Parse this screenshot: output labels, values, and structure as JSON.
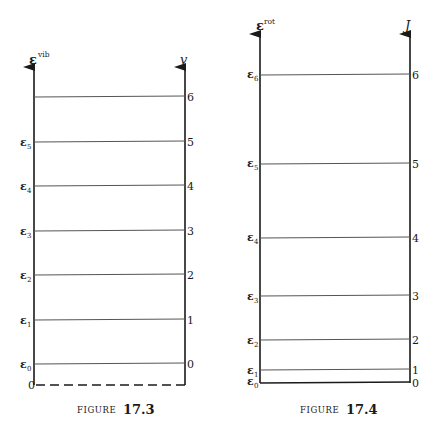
{
  "figures": [
    {
      "id": "fig-17-3",
      "caption_prefix": "FIGURE",
      "caption_number": "17.3",
      "left_axis_label": "ε",
      "left_axis_superscript": "vib",
      "right_axis_label": "v",
      "origin_label": "0",
      "baseline_style": "dashed",
      "levels": [
        {
          "quantum_number": "0",
          "energy_label": "ε",
          "energy_sub": "0",
          "y": 364
        },
        {
          "quantum_number": "1",
          "energy_label": "ε",
          "energy_sub": "1",
          "y": 320
        },
        {
          "quantum_number": "2",
          "energy_label": "ε",
          "energy_sub": "2",
          "y": 275
        },
        {
          "quantum_number": "3",
          "energy_label": "ε",
          "energy_sub": "3",
          "y": 231
        },
        {
          "quantum_number": "4",
          "energy_label": "ε",
          "energy_sub": "4",
          "y": 186
        },
        {
          "quantum_number": "5",
          "energy_label": "ε",
          "energy_sub": "5",
          "y": 142
        },
        {
          "quantum_number": "6",
          "energy_label": "",
          "energy_sub": "",
          "y": 97
        }
      ]
    },
    {
      "id": "fig-17-4",
      "caption_prefix": "FIGURE",
      "caption_number": "17.4",
      "left_axis_label": "ε",
      "left_axis_superscript": "rot",
      "right_axis_label": "J",
      "baseline_style": "solid",
      "levels": [
        {
          "quantum_number": "0",
          "energy_label": "ε",
          "energy_sub": "0",
          "y": 383
        },
        {
          "quantum_number": "1",
          "energy_label": "ε",
          "energy_sub": "1",
          "y": 370
        },
        {
          "quantum_number": "2",
          "energy_label": "ε",
          "energy_sub": "2",
          "y": 340
        },
        {
          "quantum_number": "3",
          "energy_label": "ε",
          "energy_sub": "3",
          "y": 296
        },
        {
          "quantum_number": "4",
          "energy_label": "ε",
          "energy_sub": "4",
          "y": 237
        },
        {
          "quantum_number": "5",
          "energy_label": "ε",
          "energy_sub": "5",
          "y": 163
        },
        {
          "quantum_number": "6",
          "energy_label": "ε",
          "energy_sub": "6",
          "y": 74
        }
      ]
    }
  ],
  "colors": {
    "ink": "#1a1a1a",
    "level_line": "#555555",
    "background": "#ffffff"
  }
}
